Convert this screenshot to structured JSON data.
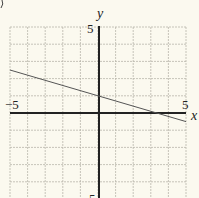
{
  "chart_data": {
    "type": "line",
    "title": "",
    "xlabel": "x",
    "ylabel": "y",
    "xlim": [
      -5,
      5
    ],
    "ylim": [
      -5,
      5
    ],
    "grid": true,
    "x_tick_labels": [
      "-5",
      "5"
    ],
    "y_tick_labels": [
      "5",
      "-5"
    ],
    "series": [
      {
        "name": "line",
        "equation": "y = -0.3x + 1",
        "x": [
          -5,
          0,
          5
        ],
        "y": [
          2.5,
          1,
          -0.5
        ]
      }
    ]
  },
  "labels": {
    "x_axis": "x",
    "y_axis": "y",
    "x_min": "−5",
    "x_max": "5",
    "y_max": "5",
    "y_min": "5"
  },
  "colors": {
    "background": "#fbf9ef",
    "grid": "#b9b6ab",
    "axis": "#222222",
    "line": "#555555"
  }
}
